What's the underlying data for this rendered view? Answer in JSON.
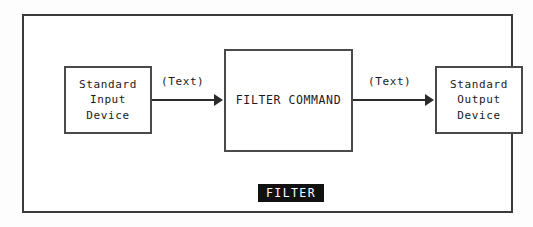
{
  "diagram": {
    "title": "FILTER",
    "nodes": [
      {
        "id": "input-device",
        "lines": [
          "Standard",
          "Input",
          "Device"
        ]
      },
      {
        "id": "filter-command",
        "label": "FILTER COMMAND"
      },
      {
        "id": "output-device",
        "lines": [
          "Standard",
          "Output",
          "Device"
        ]
      }
    ],
    "edges": [
      {
        "id": "input-to-filter",
        "label": "(Text)"
      },
      {
        "id": "filter-to-output",
        "label": "(Text)"
      }
    ],
    "caption": "FILTER",
    "colors": {
      "background": "#ffffff",
      "frame_border": "#3a3a3a",
      "box_border": "#4a4a4a",
      "text": "#1a1a1a",
      "arrow": "#2b2b2b",
      "caption_background": "#111111",
      "caption_text": "#ffffff"
    }
  }
}
